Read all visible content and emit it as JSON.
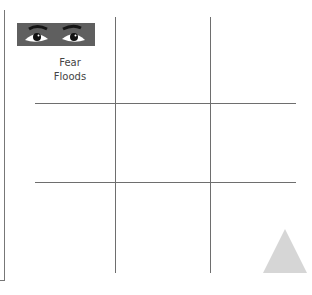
{
  "card": {
    "image": {
      "icon": "worried-eyes-icon",
      "description": "pair of wide-open eyes with raised brows"
    },
    "caption_lines": [
      "Fear",
      "Floods"
    ]
  },
  "grid": {
    "rows": 3,
    "columns": 3,
    "line_color": "#6e6e6e"
  },
  "decoration": {
    "shape": "triangle",
    "color": "#d6d6d6"
  }
}
